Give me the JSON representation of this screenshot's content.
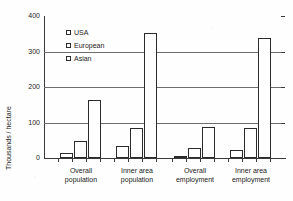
{
  "chart_data": {
    "type": "bar",
    "title": "",
    "xlabel": "",
    "ylabel": "Thousands / hectare",
    "ylim": [
      0,
      400
    ],
    "yticks": [
      0,
      100,
      200,
      300,
      400
    ],
    "grid": true,
    "legend_position": "upper-left-inside",
    "categories": [
      "Overall population",
      "Inner area population",
      "Overall employment",
      "Inner area employment"
    ],
    "category_lines": [
      [
        "Overall",
        "population"
      ],
      [
        "Inner area",
        "population"
      ],
      [
        "Overall",
        "employment"
      ],
      [
        "Inner area",
        "employment"
      ]
    ],
    "series": [
      {
        "name": "USA",
        "values": [
          14,
          35,
          6,
          23
        ]
      },
      {
        "name": "European",
        "values": [
          48,
          85,
          28,
          85
        ]
      },
      {
        "name": "Asian",
        "values": [
          163,
          352,
          88,
          337
        ]
      }
    ]
  },
  "axis": {
    "y_title": "Thousands / hectare",
    "tick_400": "400",
    "tick_300": "300",
    "tick_200": "200",
    "tick_100": "100",
    "tick_0": "0"
  },
  "legend": {
    "items": [
      {
        "label": "USA"
      },
      {
        "label": "European"
      },
      {
        "label": "Asian"
      }
    ]
  },
  "colors": {
    "bar_fill": "#ffffff",
    "bar_stroke": "#2b2b2b",
    "axis": "#3a3a3a",
    "gridline": "#6e6e6e",
    "text": "#232323",
    "background": "#fefefe"
  }
}
